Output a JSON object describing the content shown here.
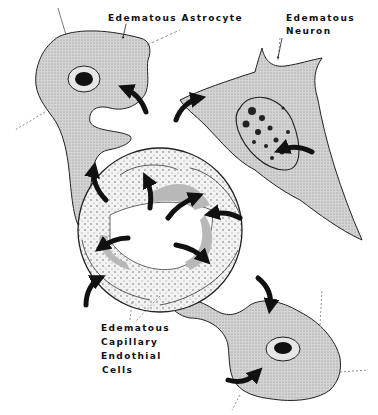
{
  "figure": {
    "labels": {
      "astrocyte": "Edematous Astrocyte",
      "neuron_line1": "Edematous",
      "neuron_line2": "Neuron",
      "capillary_line1": "Edematous",
      "capillary_line2": "Capillary",
      "capillary_line3": "Endothial",
      "capillary_line4": "Cells"
    },
    "colors": {
      "cell_fill": "#cfcfcf",
      "capillary_fill": "#ececec",
      "outline": "#222222",
      "arrow": "#111111",
      "nucleus": "#111111"
    }
  }
}
